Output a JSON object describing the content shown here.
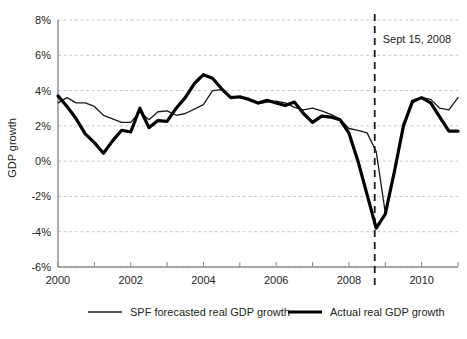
{
  "chart_data": {
    "type": "line",
    "title": "",
    "xlabel": "",
    "ylabel": "GDP growth",
    "xlim": [
      2000.0,
      2011.0
    ],
    "ylim": [
      -6,
      8
    ],
    "grid": true,
    "y_ticks": [
      8,
      6,
      4,
      2,
      0,
      -2,
      -4,
      -6
    ],
    "y_tick_labels": [
      "8%",
      "6%",
      "4%",
      "2%",
      "0%",
      "-2%",
      "-4%",
      "-6%"
    ],
    "x_ticks": [
      2000,
      2001,
      2002,
      2003,
      2004,
      2005,
      2006,
      2007,
      2008,
      2009,
      2010,
      2011
    ],
    "x_tick_labels_shown": [
      "2000",
      "2002",
      "2004",
      "2006",
      "2008",
      "2010"
    ],
    "x_labeled_ticks": [
      2000,
      2002,
      2004,
      2006,
      2008,
      2010
    ],
    "legend_position": "below-plot",
    "annotations": [
      {
        "name": "lehman-collapse-marker",
        "label": "Sept 15, 2008",
        "x": 2008.71,
        "style": "vertical-dashed-line",
        "label_x": 2008.85,
        "label_y": 6.9
      }
    ],
    "series": [
      {
        "name": "SPF forecasted real GDP growth",
        "style": "thin",
        "color": "#1a1a1a",
        "x": [
          2000.0,
          2000.25,
          2000.5,
          2000.75,
          2001.0,
          2001.25,
          2001.5,
          2001.75,
          2002.0,
          2002.25,
          2002.5,
          2002.75,
          2003.0,
          2003.25,
          2003.5,
          2003.75,
          2004.0,
          2004.25,
          2004.5,
          2004.75,
          2005.0,
          2005.25,
          2005.5,
          2005.75,
          2006.0,
          2006.25,
          2006.5,
          2006.75,
          2007.0,
          2007.25,
          2007.5,
          2007.75,
          2008.0,
          2008.25,
          2008.5,
          2008.75,
          2009.0,
          2009.25,
          2009.5,
          2009.75,
          2010.0,
          2010.25,
          2010.5,
          2010.75,
          2011.0
        ],
        "values": [
          3.3,
          3.6,
          3.3,
          3.3,
          3.1,
          2.6,
          2.4,
          2.2,
          2.2,
          2.8,
          2.35,
          2.8,
          2.85,
          2.6,
          2.7,
          2.95,
          3.2,
          4.0,
          4.05,
          3.6,
          3.6,
          3.55,
          3.25,
          3.35,
          3.4,
          3.3,
          3.05,
          2.9,
          3.0,
          2.85,
          2.65,
          2.4,
          1.85,
          1.75,
          1.6,
          0.55,
          -2.9,
          -0.6,
          2.1,
          3.3,
          3.6,
          3.5,
          3.0,
          2.9,
          3.6
        ]
      },
      {
        "name": "Actual real GDP growth",
        "style": "thick",
        "color": "#000000",
        "x": [
          2000.0,
          2000.25,
          2000.5,
          2000.75,
          2001.0,
          2001.25,
          2001.5,
          2001.75,
          2002.0,
          2002.25,
          2002.5,
          2002.75,
          2003.0,
          2003.25,
          2003.5,
          2003.75,
          2004.0,
          2004.25,
          2004.5,
          2004.75,
          2005.0,
          2005.25,
          2005.5,
          2005.75,
          2006.0,
          2006.25,
          2006.5,
          2006.75,
          2007.0,
          2007.25,
          2007.5,
          2007.75,
          2008.0,
          2008.25,
          2008.5,
          2008.75,
          2009.0,
          2009.25,
          2009.5,
          2009.75,
          2010.0,
          2010.25,
          2010.5,
          2010.75,
          2011.0
        ],
        "values": [
          3.7,
          3.1,
          2.4,
          1.55,
          1.05,
          0.45,
          1.15,
          1.75,
          1.65,
          3.0,
          1.9,
          2.3,
          2.25,
          3.0,
          3.6,
          4.4,
          4.9,
          4.7,
          4.1,
          3.6,
          3.65,
          3.5,
          3.3,
          3.45,
          3.3,
          3.15,
          3.35,
          2.7,
          2.2,
          2.55,
          2.5,
          2.35,
          1.6,
          0.0,
          -1.9,
          -3.8,
          -3.0,
          -0.6,
          2.0,
          3.4,
          3.6,
          3.3,
          2.5,
          1.7,
          1.7
        ]
      }
    ],
    "legend": [
      {
        "label": "SPF forecasted real GDP growth",
        "style": "thin"
      },
      {
        "label": "Actual real GDP growth",
        "style": "thick"
      }
    ]
  }
}
